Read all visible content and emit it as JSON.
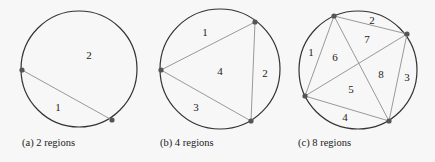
{
  "panels": [
    {
      "id": "a",
      "caption": "(a) 2 regions",
      "circle": {
        "cx": 79,
        "cy": 69,
        "r": 58
      },
      "points": [
        [
          22,
          70
        ],
        [
          112,
          120
        ]
      ],
      "chords": [
        [
          0,
          1
        ]
      ],
      "regions": [
        {
          "label": "2",
          "x": 89,
          "y": 59
        },
        {
          "label": "1",
          "x": 58,
          "y": 111
        }
      ],
      "caption_pos": {
        "x": 22,
        "y": 146
      }
    },
    {
      "id": "b",
      "caption": "(b) 4 regions",
      "circle": {
        "cx": 220,
        "cy": 69,
        "r": 60
      },
      "points": [
        [
          161,
          70
        ],
        [
          255,
          22
        ],
        [
          251,
          121
        ]
      ],
      "chords": [
        [
          0,
          1
        ],
        [
          1,
          2
        ],
        [
          2,
          0
        ]
      ],
      "regions": [
        {
          "label": "1",
          "x": 205,
          "y": 36
        },
        {
          "label": "4",
          "x": 220,
          "y": 75
        },
        {
          "label": "2",
          "x": 265,
          "y": 77
        },
        {
          "label": "3",
          "x": 196,
          "y": 111
        }
      ],
      "caption_pos": {
        "x": 160,
        "y": 146
      }
    },
    {
      "id": "c",
      "caption": "(c) 8 regions",
      "circle": {
        "cx": 358,
        "cy": 70,
        "r": 59
      },
      "points": [
        [
          334,
          16
        ],
        [
          407,
          34
        ],
        [
          389,
          121
        ],
        [
          305,
          96
        ]
      ],
      "chords": [
        [
          0,
          1
        ],
        [
          1,
          2
        ],
        [
          2,
          3
        ],
        [
          3,
          0
        ],
        [
          0,
          2
        ],
        [
          1,
          3
        ]
      ],
      "regions": [
        {
          "label": "2",
          "x": 372,
          "y": 24
        },
        {
          "label": "7",
          "x": 367,
          "y": 43
        },
        {
          "label": "1",
          "x": 311,
          "y": 56
        },
        {
          "label": "6",
          "x": 335,
          "y": 61
        },
        {
          "label": "8",
          "x": 381,
          "y": 78
        },
        {
          "label": "3",
          "x": 407,
          "y": 81
        },
        {
          "label": "5",
          "x": 351,
          "y": 93
        },
        {
          "label": "4",
          "x": 345,
          "y": 121
        }
      ],
      "caption_pos": {
        "x": 298,
        "y": 146
      }
    }
  ]
}
